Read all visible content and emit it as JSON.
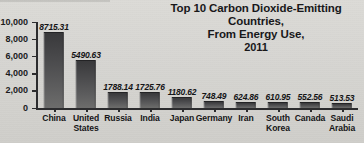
{
  "chart_data": {
    "type": "bar",
    "title": "Top 10 Carbon Dioxide-Emitting Countries, From Energy Use, 2011",
    "title_line1": "Top 10 Carbon Dioxide-Emitting Countries,",
    "title_line2": "From Energy Use,",
    "title_line3": "2011",
    "xlabel": "",
    "ylabel": "",
    "ylim": [
      0,
      10000
    ],
    "yticks": [
      0,
      2000,
      4000,
      6000,
      8000,
      10000
    ],
    "ytick_labels": [
      "0",
      "2,000",
      "4,000",
      "6,000",
      "8,000",
      "10,000"
    ],
    "grid": false,
    "legend": false,
    "categories": [
      "China",
      "United States",
      "Russia",
      "India",
      "Japan",
      "Germany",
      "Iran",
      "South Korea",
      "Canada",
      "Saudi Arabia"
    ],
    "category_labels": [
      "China",
      "United\nStates",
      "Russia",
      "India",
      "Japan",
      "Germany",
      "Iran",
      "South\nKorea",
      "Canada",
      "Saudi\nArabia"
    ],
    "values": [
      8715.31,
      5490.63,
      1788.14,
      1725.76,
      1180.62,
      748.49,
      624.86,
      610.95,
      552.56,
      513.53
    ],
    "value_labels": [
      "8715.31",
      "5490.63",
      "1788.14",
      "1725.76",
      "1180.62",
      "748.49",
      "624.86",
      "610.95",
      "552.56",
      "513.53"
    ],
    "colors": {
      "background": "#d8d7d3",
      "bar_top": "#39393b",
      "bar_bottom": "#6d6d6c",
      "axis": "#2c2c2e",
      "text": "#151517"
    }
  }
}
